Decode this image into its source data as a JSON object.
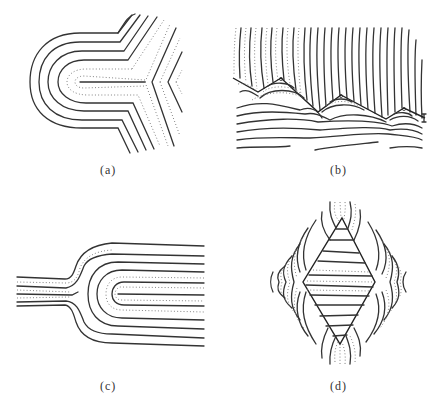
{
  "figure": {
    "panels": [
      {
        "id": "a",
        "label": "(a)",
        "description": "Nested U-shaped contour lines opening to the right, with diagonal lines converging into a Y-shaped junction"
      },
      {
        "id": "b",
        "label": "(b)",
        "description": "Zigzag boundary separating near-vertical curved lines above from arcs and wavy horizontal lines below"
      },
      {
        "id": "c",
        "label": "(c)",
        "description": "Narrow stem of parallel lines on the left flaring into nested U-shaped contours opening to the right"
      },
      {
        "id": "d",
        "label": "(d)",
        "description": "Diamond-shaped region with horizontal lines inside, surrounded by curved contour lines"
      }
    ]
  },
  "colors": {
    "line": "#333333",
    "dotted": "#777777",
    "background": "#ffffff"
  }
}
